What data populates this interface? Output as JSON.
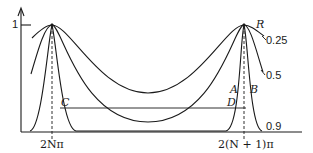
{
  "diagram": {
    "y_axis": {
      "tick_label": "1"
    },
    "x_axis": {
      "tick_labels": [
        "2Nπ",
        "2(N + 1)π"
      ]
    },
    "legend": {
      "parameter": "R",
      "curves": [
        "0.25",
        "0.5",
        "0.9"
      ]
    },
    "points": [
      "A",
      "B",
      "C",
      "D"
    ],
    "colors": {
      "ink": "#1a1a1a",
      "background": "#ffffff"
    }
  }
}
